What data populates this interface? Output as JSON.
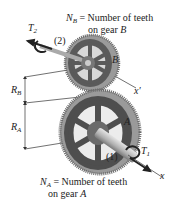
{
  "diagram": {
    "type": "gear-train",
    "gear_b": {
      "label": "B",
      "count_symbol": "N",
      "count_sub": "B",
      "count_desc_line1": "= Number of teeth",
      "count_desc_line2": "on gear",
      "count_desc_gear": "B",
      "radius_symbol": "R",
      "radius_sub": "B"
    },
    "gear_a": {
      "label": "A",
      "count_symbol": "N",
      "count_sub": "A",
      "count_desc_line1": "= Number of teeth",
      "count_desc_line2": "on gear",
      "count_desc_gear": "A",
      "radius_symbol": "R",
      "radius_sub": "A"
    },
    "torque_2": {
      "symbol": "T",
      "sub": "2",
      "point": "(2)"
    },
    "torque_1": {
      "symbol": "T",
      "sub": "1",
      "point": "(1)"
    },
    "axis_x": "x",
    "axis_x_prime": "x′",
    "colors": {
      "gear_dark": "#4a4a4a",
      "gear_mid": "#6e6e6e",
      "gear_light": "#a8a8a8",
      "shaft": "#c8c8c8",
      "line": "#333333"
    }
  }
}
